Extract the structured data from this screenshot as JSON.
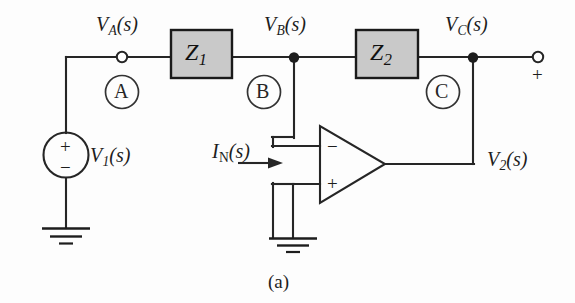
{
  "figure": {
    "caption": "(a)",
    "type": "circuit-schematic",
    "colors": {
      "wire": "#262626",
      "impedance_box_fill": "#c9c9c9",
      "impedance_box_stroke": "#1a1a1a",
      "background": "#fdfdfd",
      "text": "#1d1d1d"
    }
  },
  "labels": {
    "v_a": {
      "symbol": "V",
      "sub": "A",
      "arg": "(s)"
    },
    "v_b": {
      "symbol": "V",
      "sub": "B",
      "arg": "(s)"
    },
    "v_c": {
      "symbol": "V",
      "sub": "C",
      "arg": "(s)"
    },
    "v_1": {
      "symbol": "V",
      "sub": "1",
      "arg": "(s)"
    },
    "v_2": {
      "symbol": "V",
      "sub": "2",
      "arg": "(s)"
    },
    "i_n": {
      "symbol": "I",
      "sub": "N",
      "arg": "(s)"
    }
  },
  "components": {
    "z1": {
      "symbol": "Z",
      "sub": "1"
    },
    "z2": {
      "symbol": "Z",
      "sub": "2"
    },
    "source_plus": "+",
    "source_minus": "−",
    "opamp_inverting": "−",
    "opamp_noninverting": "+",
    "output_terminal_polarity": "+"
  },
  "nodes": [
    {
      "id": "A",
      "letter": "A"
    },
    {
      "id": "B",
      "letter": "B"
    },
    {
      "id": "C",
      "letter": "C"
    }
  ]
}
